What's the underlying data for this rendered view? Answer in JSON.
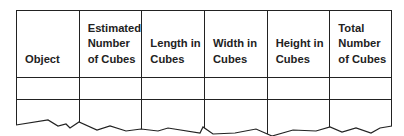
{
  "table": {
    "columns": [
      {
        "label": "Object"
      },
      {
        "label": "Estimated Number of Cubes"
      },
      {
        "label": "Length in Cubes"
      },
      {
        "label": "Width in Cubes"
      },
      {
        "label": "Height in Cubes"
      },
      {
        "label": "Total Number of Cubes"
      }
    ],
    "rows": [
      [
        "",
        "",
        "",
        "",
        "",
        ""
      ],
      [
        "",
        "",
        "",
        "",
        "",
        ""
      ]
    ]
  }
}
